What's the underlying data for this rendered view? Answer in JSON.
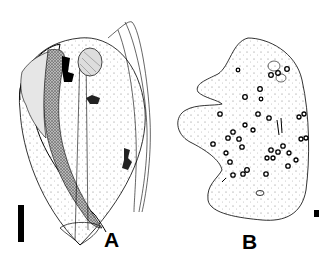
{
  "figure": {
    "panels": [
      {
        "id": "A",
        "label": "A",
        "subject": "ciliate cell, lateral view with oral apparatus and macronucleus",
        "scale_bar": "long vertical bar"
      },
      {
        "id": "B",
        "label": "B",
        "subject": "cell outline with scattered inclusions",
        "scale_bar": "small square bar"
      }
    ]
  },
  "colors": {
    "ink": "#000000",
    "background": "#ffffff",
    "stipple": "#555555"
  }
}
